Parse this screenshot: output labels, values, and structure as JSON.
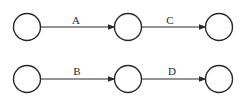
{
  "diagram": {
    "type": "activity-network",
    "nodes": [
      {
        "id": "n1",
        "cx": 27,
        "cy": 27,
        "r": 13.5
      },
      {
        "id": "n2",
        "cx": 128,
        "cy": 27,
        "r": 13.5
      },
      {
        "id": "n3",
        "cx": 219,
        "cy": 27,
        "r": 13.5
      },
      {
        "id": "n4",
        "cx": 27,
        "cy": 79,
        "r": 13.5
      },
      {
        "id": "n5",
        "cx": 128,
        "cy": 79,
        "r": 13.5
      },
      {
        "id": "n6",
        "cx": 219,
        "cy": 79,
        "r": 13.5
      }
    ],
    "edges": [
      {
        "from": "n1",
        "to": "n2",
        "label": "A"
      },
      {
        "from": "n2",
        "to": "n3",
        "label": "C"
      },
      {
        "from": "n4",
        "to": "n5",
        "label": "B"
      },
      {
        "from": "n5",
        "to": "n6",
        "label": "D"
      }
    ],
    "colors": {
      "stroke": "#2a2a2a",
      "background": "#ffffff"
    }
  }
}
